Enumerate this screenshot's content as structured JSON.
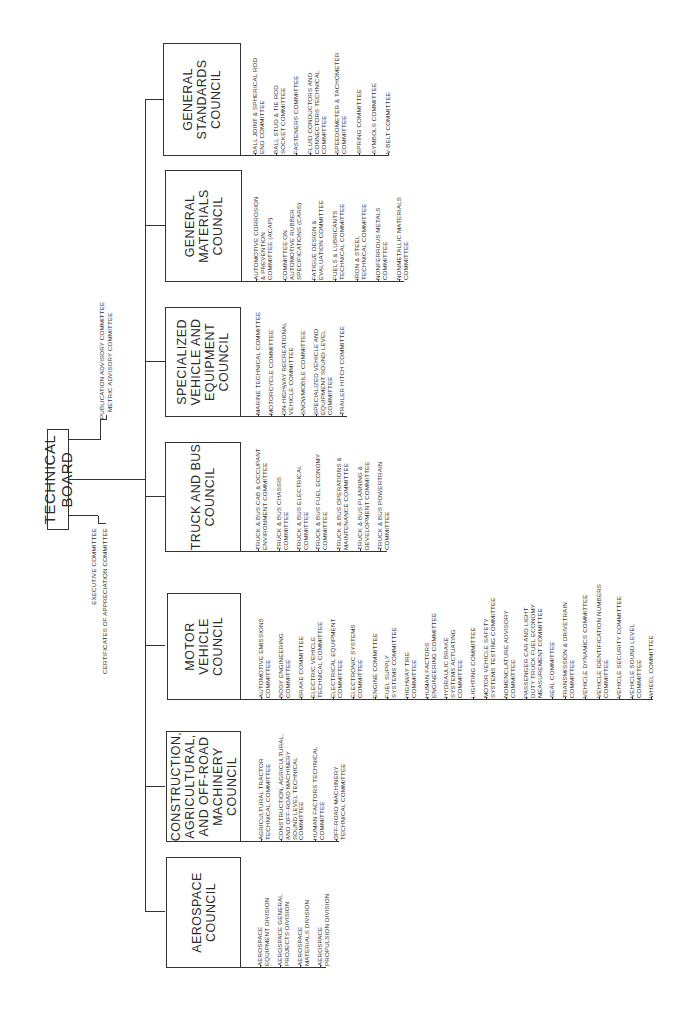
{
  "chart_data": {
    "type": "org-chart",
    "orientation": "rotated-90-ccw",
    "root": "TECHNICAL BOARD",
    "advisory_committees": [
      "PUBLICATION ADVISORY COMMITTEE",
      "METRIC ADVISORY COMMITTEE",
      "EXECUTIVE COMMITTEE",
      "CERTIFICATES OF APPRECIATION COMMITTEE"
    ],
    "councils": [
      "GENERAL STANDARDS COUNCIL",
      "GENERAL MATERIALS COUNCIL",
      "SPECIALIZED VEHICLE AND EQUIPMENT COUNCIL",
      "TRUCK AND BUS COUNCIL",
      "MOTOR VEHICLE COUNCIL",
      "CONSTRUCTION, AGRICULTURAL, AND OFF-ROAD MACHINERY COUNCIL",
      "AEROSPACE COUNCIL"
    ]
  },
  "board": {
    "title": "TECHNICAL BOARD",
    "upper_committees": [
      "PUBLICATION ADVISORY COMMITTEE",
      "METRIC ADVISORY COMMITTEE"
    ],
    "lower_committees": [
      "EXECUTIVE COMMITTEE",
      "CERTIFICATES OF APPRECIATION COMMITTEE"
    ]
  },
  "councils": [
    {
      "name": "GENERAL\nSTANDARDS\nCOUNCIL",
      "committees": [
        "BALL JOINT & SPHERICAL ROD\nEND COMMITTEE",
        "BALL STUD & TIE ROD\nSOCKET COMMITTEE",
        "FASTENERS COMMITTEE",
        "FLUID CONDUCTORS AND\nCONNECTORS TECHNICAL\nCOMMITTEE",
        "SPEEDOMETER & TACHOMETER\nCOMMITTEE",
        "SPRING COMMITTEE",
        "SYMBOLS COMMITTEE",
        "V-BELT COMMITTEE"
      ]
    },
    {
      "name": "GENERAL\nMATERIALS\nCOUNCIL",
      "committees": [
        "AUTOMOTIVE CORROSION\n& PREVENTION\nCOMMITTEE (ACAP)",
        "COMMITTEE ON\nAUTOMOTIVE RUBBER\nSPECIFICATIONS (CARS)",
        "FATIGUE DESIGN &\nEVALUATION COMMITTEE",
        "FUELS & LUBRICANTS\nTECHNICAL COMMITTEE",
        "IRON & STEEL\nTECHNICAL COMMITTEE",
        "NONFERROUS METALS\nCOMMITTEE",
        "NONMETALLIC MATERIALS\nCOMMITTEE"
      ]
    },
    {
      "name": "SPECIALIZED\nVEHICLE AND\nEQUIPMENT\nCOUNCIL",
      "committees": [
        "MARINE TECHNICAL COMMITTEE",
        "MOTORCYCLE COMMITTEE",
        "ON-HIGHWAY RECREATIONAL\nVEHICLE COMMITTEE",
        "SNOWMOBILE COMMITTEE",
        "SPECIALIZED VEHICLE AND\nEQUIPMENT SOUND LEVEL\nCOMMITTEE",
        "TRAILER HITCH COMMITTEE"
      ]
    },
    {
      "name": "TRUCK AND BUS\nCOUNCIL",
      "committees": [
        "TRUCK & BUS CAB & OCCUPANT\nENVIRONMENT COMMITTEE",
        "TRUCK & BUS CHASSIS\nCOMMITTEE",
        "TRUCK & BUS ELECTRICAL\nCOMMITTEE",
        "TRUCK & BUS FUEL ECONOMY\nCOMMITTEE",
        "TRUCK & BUS OPERATIONS &\nMAINTENANCE COMMITTEE",
        "TRUCK & BUS PLANNING &\nDEVELOPMENT COMMITTEE",
        "TRUCK & BUS POWERTRAIN\nCOMMITTEE"
      ]
    },
    {
      "name": "MOTOR\nVEHICLE\nCOUNCIL",
      "committees": [
        "AUTOMOTIVE EMISSIONS\nCOMMITTEE",
        "BODY ENGINEERING\nCOMMITTEE",
        "BRAKE COMMITTEE",
        "ELECTRIC VEHICLE\nTECHNICAL COMMITTEE",
        "ELECTRICAL EQUIPMENT\nCOMMITTEE",
        "ELECTRONIC SYSTEMS\nCOMMITTEE",
        "ENGINE COMMITTEE",
        "FUEL SUPPLY\nSYSTEMS COMMITTEE",
        "HIGHWAY TIRE\nCOMMITTEE",
        "HUMAN FACTORS\nENGINEERING COMMITTEE",
        "HYDRAULIC BRAKE\nSYSTEMS ACTUATING\nCOMMITTEE",
        "LIGHTING COMMITTEE",
        "MOTOR VEHICLE SAFETY\nSYSTEMS TESTING COMMITTEE",
        "NOMENCLATURE ADVISORY\nCOMMITTEE",
        "PASSENGER CAR AND LIGHT\nDUTY TRUCK FUEL ECONOMY\nMEASUREMENT COMMITTEE",
        "SEAL COMMITTEE",
        "TRANSMISSION & DRIVETRAIN\nCOMMITTEE",
        "VEHICLE DYNAMICS COMMITTEE",
        "VEHICLE IDENTIFICATION NUMBERS\nCOMMITTEE",
        "VEHICLE SECURITY COMMITTEE",
        "VEHICLE SOUND LEVEL\nCOMMITTEE",
        "WHEEL COMMITTEE"
      ]
    },
    {
      "name": "CONSTRUCTION,\nAGRICULTURAL,\nAND OFF-ROAD\nMACHINERY\nCOUNCIL",
      "committees": [
        "AGRICULTURAL TRACTOR\nTECHNICAL COMMITTEE",
        "CONSTRUCTION, AGRICULTURAL,\nAND OFF-ROAD MACHINERY\nSOUND LEVEL TECHNICAL\nCOMMITTEE",
        "HUMAN FACTORS TECHNICAL\nCOMMITTEE",
        "OFF-ROAD MACHINERY\nTECHNICAL COMMITTEE"
      ]
    },
    {
      "name": "AEROSPACE\nCOUNCIL",
      "committees": [
        "AEROSPACE\nEQUIPMENT DIVISION",
        "AEROSPACE GENERAL\nPROJECTS DIVISION",
        "AEROSPACE\nMATERIALS DIVISION",
        "AEROSPACE\nPROPULSION DIVISION"
      ]
    }
  ]
}
